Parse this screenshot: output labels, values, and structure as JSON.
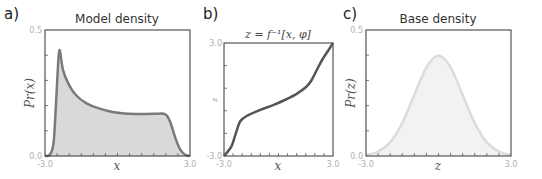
{
  "chart_data": [
    {
      "panel": "a)",
      "type": "area",
      "title": "Model density",
      "xlabel": "x",
      "ylabel": "Pr(x)",
      "xlim": [
        -3.0,
        3.0
      ],
      "ylim": [
        0.0,
        0.5
      ],
      "xtick_labels": [
        "-3.0",
        "3.0"
      ],
      "ytick_labels": [
        "0.0",
        "0.5"
      ],
      "grid": false,
      "series": [
        {
          "name": "model density",
          "x": [
            -3.0,
            -2.8,
            -2.65,
            -2.55,
            -2.45,
            -2.4,
            -2.35,
            -2.25,
            -2.0,
            -1.7,
            -1.3,
            -0.8,
            -0.2,
            0.5,
            1.2,
            1.7,
            1.9,
            2.05,
            2.2,
            2.4,
            2.6,
            2.8,
            3.0
          ],
          "y": [
            0.0,
            0.005,
            0.05,
            0.2,
            0.38,
            0.42,
            0.4,
            0.34,
            0.28,
            0.24,
            0.21,
            0.19,
            0.175,
            0.168,
            0.167,
            0.168,
            0.168,
            0.16,
            0.13,
            0.07,
            0.025,
            0.005,
            0.0
          ]
        }
      ],
      "colors": {
        "line": "#7a7a7a",
        "fill": "#d9d9d9"
      }
    },
    {
      "panel": "b)",
      "type": "line",
      "title": "z = f⁻¹[x, φ]",
      "xlabel": "x",
      "ylabel": "z",
      "xlim": [
        -3.0,
        3.0
      ],
      "ylim": [
        -3.0,
        3.0
      ],
      "xtick_labels": [
        "-3.0",
        "3.0"
      ],
      "ytick_labels": [
        "-3.0",
        "3.0"
      ],
      "grid": false,
      "series": [
        {
          "name": "inverse mapping",
          "x": [
            -3.0,
            -2.6,
            -2.35,
            -2.1,
            -1.7,
            -1.0,
            -0.3,
            0.4,
            1.0,
            1.5,
            1.8,
            2.1,
            2.4,
            2.7,
            3.0
          ],
          "y": [
            -3.0,
            -2.5,
            -1.8,
            -1.15,
            -0.85,
            -0.55,
            -0.3,
            0.0,
            0.3,
            0.65,
            1.0,
            1.55,
            2.1,
            2.55,
            3.0
          ]
        }
      ],
      "colors": {
        "line": "#555555"
      }
    },
    {
      "panel": "c)",
      "type": "area",
      "title": "Base density",
      "xlabel": "z",
      "ylabel": "Pr(z)",
      "xlim": [
        -3.0,
        3.0
      ],
      "ylim": [
        0.0,
        0.5
      ],
      "xtick_labels": [
        "-3.0",
        "3.0"
      ],
      "ytick_labels": [
        "0.0",
        "0.5"
      ],
      "grid": false,
      "series": [
        {
          "name": "standard normal",
          "x": [
            -3.0,
            -2.5,
            -2.0,
            -1.5,
            -1.0,
            -0.5,
            0.0,
            0.5,
            1.0,
            1.5,
            2.0,
            2.5,
            3.0
          ],
          "y": [
            0.004,
            0.018,
            0.054,
            0.13,
            0.242,
            0.352,
            0.399,
            0.352,
            0.242,
            0.13,
            0.054,
            0.018,
            0.004
          ]
        }
      ],
      "colors": {
        "line": "#dcdcdc",
        "fill": "#f2f2f2"
      }
    }
  ],
  "panels": {
    "a": {
      "letter": "a)",
      "title": "Model density",
      "ylabel": "Pr(x)",
      "xlabel": "x",
      "ytop": "0.5",
      "ybot": "0.0",
      "xleft": "-3.0",
      "xright": "3.0"
    },
    "b": {
      "letter": "b)",
      "title": "z = f⁻¹[x, φ]",
      "ylabel": "z",
      "xlabel": "x",
      "ytop": "3.0",
      "ybot": "-3.0",
      "xleft": "-3.0",
      "xright": "3.0"
    },
    "c": {
      "letter": "c)",
      "title": "Base density",
      "ylabel": "Pr(z)",
      "xlabel": "z",
      "ytop": "0.5",
      "ybot": "0.0",
      "xleft": "-3.0",
      "xright": "3.0"
    }
  }
}
